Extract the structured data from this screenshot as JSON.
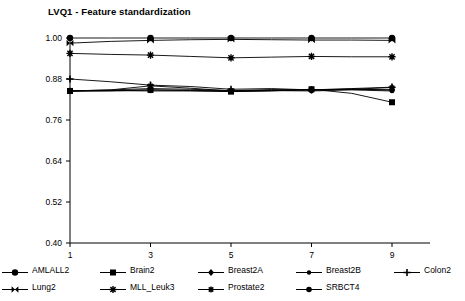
{
  "chart_data": {
    "type": "line",
    "title": "LVQ1 - Feature standardization",
    "xlabel": "",
    "ylabel": "",
    "xlim": [
      1,
      9
    ],
    "ylim": [
      0.4,
      1.0
    ],
    "x": [
      1,
      2,
      3,
      4,
      5,
      6,
      7,
      8,
      9
    ],
    "xticks": [
      "1",
      "3",
      "5",
      "7",
      "9"
    ],
    "xtick_values": [
      1,
      3,
      5,
      7,
      9
    ],
    "yticks": [
      "1.00",
      "0.88",
      "0.76",
      "0.64",
      "0.52",
      "0.40"
    ],
    "ytick_values": [
      1.0,
      0.88,
      0.76,
      0.64,
      0.52,
      0.4
    ],
    "grid": false,
    "legend_position": "bottom",
    "line_color": "#000000",
    "series": [
      {
        "name": "AMLALL2",
        "marker": "circle",
        "values": [
          1.0,
          1.0,
          1.0,
          1.0,
          1.0,
          1.0,
          1.0,
          1.0,
          1.0
        ]
      },
      {
        "name": "Brain2",
        "marker": "square",
        "values": [
          0.845,
          0.845,
          0.848,
          0.846,
          0.843,
          0.845,
          0.85,
          0.838,
          0.812
        ]
      },
      {
        "name": "Breast2A",
        "marker": "diamond",
        "values": [
          0.845,
          0.848,
          0.852,
          0.85,
          0.846,
          0.849,
          0.848,
          0.85,
          0.848
        ]
      },
      {
        "name": "Breast2B",
        "marker": "circle-small",
        "values": [
          0.845,
          0.846,
          0.845,
          0.845,
          0.844,
          0.846,
          0.845,
          0.848,
          0.845
        ]
      },
      {
        "name": "Colon2",
        "marker": "plus",
        "values": [
          0.88,
          0.872,
          0.862,
          0.858,
          0.85,
          0.852,
          0.848,
          0.852,
          0.856
        ]
      },
      {
        "name": "Lung2",
        "marker": "bowtie",
        "values": [
          0.985,
          0.99,
          0.993,
          0.995,
          0.996,
          0.995,
          0.994,
          0.994,
          0.993
        ]
      },
      {
        "name": "MLL_Leuk3",
        "marker": "star",
        "values": [
          0.955,
          0.952,
          0.95,
          0.946,
          0.942,
          0.944,
          0.946,
          0.945,
          0.945
        ]
      },
      {
        "name": "Prostate2",
        "marker": "star-small",
        "values": [
          0.845,
          0.848,
          0.86,
          0.853,
          0.845,
          0.846,
          0.848,
          0.85,
          0.855
        ]
      },
      {
        "name": "SRBCT4",
        "marker": "circle-filled",
        "values": [
          0.845,
          0.846,
          0.848,
          0.847,
          0.845,
          0.847,
          0.849,
          0.85,
          0.848
        ]
      }
    ]
  },
  "legend": {
    "row1": [
      {
        "label": "AMLALL2",
        "marker": "circle"
      },
      {
        "label": "Brain2",
        "marker": "square"
      },
      {
        "label": "Breast2A",
        "marker": "diamond"
      },
      {
        "label": "Breast2B",
        "marker": "circle-small"
      },
      {
        "label": "Colon2",
        "marker": "plus"
      }
    ],
    "row2": [
      {
        "label": "Lung2",
        "marker": "bowtie"
      },
      {
        "label": "MLL_Leuk3",
        "marker": "star"
      },
      {
        "label": "Prostate2",
        "marker": "star-small"
      },
      {
        "label": "SRBCT4",
        "marker": "circle-filled"
      }
    ]
  }
}
